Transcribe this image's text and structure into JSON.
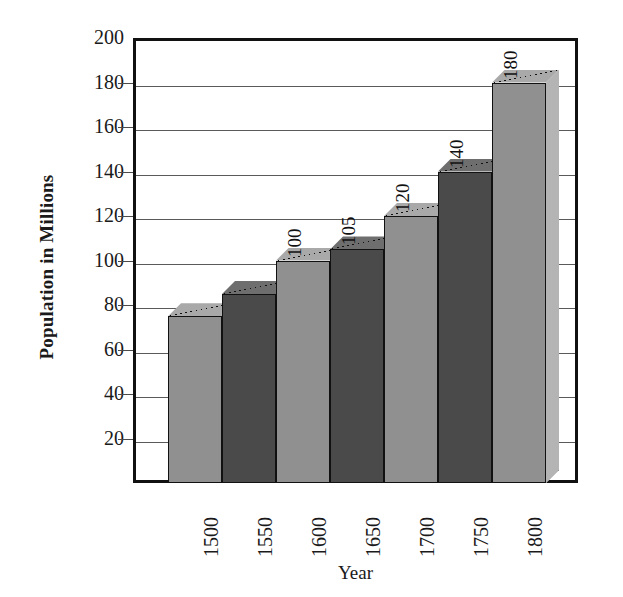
{
  "chart_data": {
    "type": "bar",
    "title": "",
    "subtitle": "",
    "xlabel": "Year",
    "ylabel": "Population in Millions",
    "categories": [
      "1500",
      "1550",
      "1600",
      "1650",
      "1700",
      "1750",
      "1800"
    ],
    "values": [
      75,
      85,
      100,
      105,
      120,
      140,
      180
    ],
    "data_labels": [
      "",
      "",
      "100",
      "105",
      "120",
      "140",
      "180"
    ],
    "ylim": [
      0,
      200
    ],
    "ytick_labels": [
      "20",
      "40",
      "60",
      "80",
      "100",
      "120",
      "140",
      "160",
      "180",
      "200"
    ],
    "ytick_values": [
      20,
      40,
      60,
      80,
      100,
      120,
      140,
      160,
      180,
      200
    ],
    "grid": true,
    "legend": "none",
    "style": "3d-column",
    "series": [
      {
        "name": "Population",
        "values": [
          75,
          85,
          100,
          105,
          120,
          140,
          180
        ]
      }
    ],
    "bar_colors": [
      "#909090",
      "#4a4a4a",
      "#909090",
      "#4a4a4a",
      "#909090",
      "#4a4a4a",
      "#909090"
    ],
    "bar_top_colors": [
      "#a9a9a9",
      "#6e6e6e",
      "#a9a9a9",
      "#6e6e6e",
      "#a9a9a9",
      "#6e6e6e",
      "#a9a9a9"
    ],
    "bar_side_colors": [
      "#b4b4b4",
      "#7a7a7a",
      "#b4b4b4",
      "#7a7a7a",
      "#b4b4b4",
      "#7a7a7a",
      "#b4b4b4"
    ]
  },
  "colors": {
    "frame": "#111111",
    "gridline": "#5a5a5a",
    "background": "#ffffff",
    "text": "#1a1a1a",
    "light_bar": "#909090",
    "dark_bar": "#4a4a4a"
  }
}
